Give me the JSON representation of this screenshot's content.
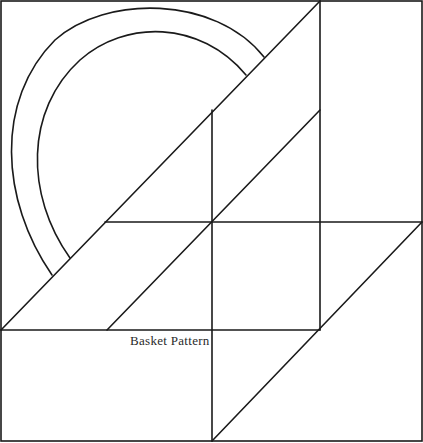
{
  "diagram": {
    "title": "Basket Pattern",
    "stroke_color": "#1a1a1a",
    "background": "#ffffff",
    "frame": {
      "x1": 1,
      "y1": 1,
      "x2": 422,
      "y2": 441
    },
    "lines": [
      {
        "name": "vertical-right-divider",
        "x1": 320,
        "y1": 1,
        "x2": 320,
        "y2": 330
      },
      {
        "name": "vertical-center-divider",
        "x1": 212,
        "y1": 110,
        "x2": 212,
        "y2": 441
      },
      {
        "name": "horizontal-middle",
        "x1": 105,
        "y1": 222,
        "x2": 422,
        "y2": 222
      },
      {
        "name": "horizontal-lower",
        "x1": 1,
        "y1": 330,
        "x2": 320,
        "y2": 330
      },
      {
        "name": "diagonal-basket-left",
        "x1": 1,
        "y1": 330,
        "x2": 320,
        "y2": 1
      },
      {
        "name": "diagonal-basket-inner",
        "x1": 107,
        "y1": 330,
        "x2": 320,
        "y2": 110
      },
      {
        "name": "diagonal-basket-right",
        "x1": 212,
        "y1": 441,
        "x2": 422,
        "y2": 222
      }
    ],
    "arcs": [
      {
        "name": "handle-outer-arc",
        "d": "M 52 275 C 0 200, -5 100, 55 40 C 105 -5, 215 -5, 264 57"
      },
      {
        "name": "handle-inner-arc",
        "d": "M 70 258 C 25 195, 25 110, 80 60 C 125 20, 200 20, 246 75"
      }
    ],
    "label_position": {
      "x": 130,
      "y": 333
    }
  }
}
